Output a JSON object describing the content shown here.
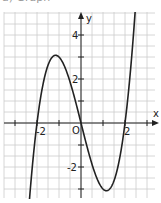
{
  "header": {
    "cut_text": "a) Graph"
  },
  "chart_data": {
    "type": "line",
    "title": "",
    "function": "f(x) = x^3 - 4x",
    "xlabel": "x",
    "ylabel": "y",
    "origin_label": "O",
    "x_tick_labels": [
      {
        "value": -2,
        "label": "-2"
      },
      {
        "value": 2,
        "label": "2"
      }
    ],
    "y_tick_labels": [
      {
        "value": 4,
        "label": "4"
      },
      {
        "value": 2,
        "label": "2"
      },
      {
        "value": -2,
        "label": "-2"
      }
    ],
    "xlim": [
      -3.5,
      3.4
    ],
    "ylim": [
      -3.4,
      5.1
    ],
    "grid": true,
    "grid_step": 0.5,
    "key_points": [
      {
        "x": -2,
        "y": 0,
        "label": "root"
      },
      {
        "x": 0,
        "y": 0,
        "label": "root"
      },
      {
        "x": 2,
        "y": 0,
        "label": "root"
      },
      {
        "x": -1.15,
        "y": 3.08,
        "label": "local max"
      },
      {
        "x": 1.15,
        "y": -3.08,
        "label": "local min"
      }
    ]
  },
  "style": {
    "curve_color": "#222222",
    "grid_color": "#cccccc",
    "axis_color": "#222222"
  }
}
